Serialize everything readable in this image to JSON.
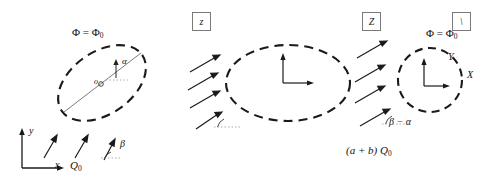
{
  "figure": {
    "title_boxes": [
      {
        "name": "box-z-lower",
        "text": "z"
      },
      {
        "name": "box-z-upper",
        "text": "Z"
      },
      {
        "name": "box-slash",
        "text": "\\"
      }
    ]
  },
  "panel_left": {
    "flux_label": "Φ = Φ",
    "flux_sub": "0",
    "center_point": "o",
    "angle_alpha": "α",
    "angle_beta": "β",
    "axis_x": "x",
    "axis_y": "y",
    "source_label": "Q",
    "source_sub": "0",
    "arrow_count": 3,
    "ellipse": {
      "cx": 102,
      "cy": 83,
      "rx": 49,
      "ry": 31,
      "rotation": -35
    }
  },
  "panel_mid": {
    "flux_label": "Φ = Φ",
    "flux_sub": "0",
    "axis_x": "X",
    "axis_y": "Y",
    "angle_label": "β − α",
    "amplitude_label": "(a + b) Q",
    "amplitude_sub": "0",
    "arrow_count": 4,
    "ellipse": {
      "cx": 288,
      "cy": 83,
      "rx": 62,
      "ry": 38,
      "rotation": 0
    }
  },
  "panel_right": {
    "flux_label": "Φ = Φ",
    "flux_sub": "0",
    "axis_tau": "τ",
    "axis_omega": "ω",
    "angle_label": "β − α",
    "amplitude_frac_num": "1",
    "amplitude_frac_den": "2",
    "amplitude_label": "(a + b) Q",
    "amplitude_sub": "0",
    "arrow_count": 4,
    "circle": {
      "cx": 430,
      "cy": 80,
      "r": 32
    }
  },
  "style": {
    "stroke_color": "#1a1a1a",
    "thin_stroke_color": "#555555",
    "box_border_color": "#7a7a7a",
    "background": "#ffffff"
  }
}
